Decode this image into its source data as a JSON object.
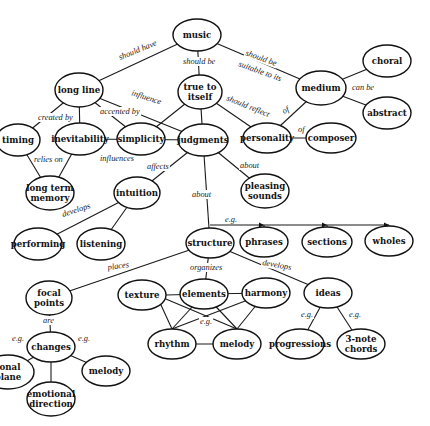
{
  "diagram": {
    "nodes": [
      {
        "id": "music",
        "lines": [
          "music"
        ],
        "x": 197,
        "y": 35,
        "rx": 24,
        "ry": 16
      },
      {
        "id": "long_line",
        "lines": [
          "long line"
        ],
        "x": 79,
        "y": 90,
        "rx": 24,
        "ry": 17
      },
      {
        "id": "true_to_itself",
        "lines": [
          "true to",
          "itself"
        ],
        "x": 200,
        "y": 92,
        "rx": 22,
        "ry": 17
      },
      {
        "id": "medium",
        "lines": [
          "medium"
        ],
        "x": 321,
        "y": 88,
        "rx": 25,
        "ry": 17
      },
      {
        "id": "choral",
        "lines": [
          "choral"
        ],
        "x": 387,
        "y": 61,
        "rx": 24,
        "ry": 16
      },
      {
        "id": "abstract",
        "lines": [
          "abstract"
        ],
        "x": 387,
        "y": 113,
        "rx": 24,
        "ry": 16
      },
      {
        "id": "timing",
        "lines": [
          "timing"
        ],
        "x": 18,
        "y": 140,
        "rx": 22,
        "ry": 16
      },
      {
        "id": "inevitability",
        "lines": [
          "inevitability"
        ],
        "x": 80,
        "y": 139,
        "rx": 25,
        "ry": 16
      },
      {
        "id": "simplicity",
        "lines": [
          "simplicity"
        ],
        "x": 141,
        "y": 139,
        "rx": 24,
        "ry": 16
      },
      {
        "id": "judgments",
        "lines": [
          "judgments"
        ],
        "x": 203,
        "y": 140,
        "rx": 25,
        "ry": 16
      },
      {
        "id": "personality",
        "lines": [
          "personality"
        ],
        "x": 267,
        "y": 138,
        "rx": 24,
        "ry": 15
      },
      {
        "id": "composer",
        "lines": [
          "composer"
        ],
        "x": 331,
        "y": 138,
        "rx": 25,
        "ry": 15
      },
      {
        "id": "long_term_memory",
        "lines": [
          "long term",
          "memory"
        ],
        "x": 50,
        "y": 193,
        "rx": 24,
        "ry": 17
      },
      {
        "id": "intuition",
        "lines": [
          "intuition"
        ],
        "x": 137,
        "y": 193,
        "rx": 23,
        "ry": 16
      },
      {
        "id": "pleasing_sounds",
        "lines": [
          "pleasing",
          "sounds"
        ],
        "x": 265,
        "y": 191,
        "rx": 24,
        "ry": 17
      },
      {
        "id": "performing",
        "lines": [
          "performing"
        ],
        "x": 38,
        "y": 244,
        "rx": 24,
        "ry": 16
      },
      {
        "id": "listening",
        "lines": [
          "listening"
        ],
        "x": 101,
        "y": 244,
        "rx": 24,
        "ry": 16
      },
      {
        "id": "structure",
        "lines": [
          "structure"
        ],
        "x": 210,
        "y": 243,
        "rx": 24,
        "ry": 15
      },
      {
        "id": "phrases",
        "lines": [
          "phrases"
        ],
        "x": 264,
        "y": 242,
        "rx": 24,
        "ry": 15
      },
      {
        "id": "sections",
        "lines": [
          "sections"
        ],
        "x": 327,
        "y": 242,
        "rx": 25,
        "ry": 15
      },
      {
        "id": "wholes",
        "lines": [
          "wholes"
        ],
        "x": 389,
        "y": 241,
        "rx": 24,
        "ry": 15
      },
      {
        "id": "focal_points",
        "lines": [
          "focal",
          "points"
        ],
        "x": 49,
        "y": 298,
        "rx": 23,
        "ry": 17
      },
      {
        "id": "texture",
        "lines": [
          "texture"
        ],
        "x": 142,
        "y": 295,
        "rx": 24,
        "ry": 15
      },
      {
        "id": "elements",
        "lines": [
          "elements"
        ],
        "x": 204,
        "y": 294,
        "rx": 24,
        "ry": 15
      },
      {
        "id": "harmony",
        "lines": [
          "harmony"
        ],
        "x": 266,
        "y": 293,
        "rx": 24,
        "ry": 15
      },
      {
        "id": "ideas",
        "lines": [
          "ideas"
        ],
        "x": 328,
        "y": 293,
        "rx": 24,
        "ry": 15
      },
      {
        "id": "changes",
        "lines": [
          "changes"
        ],
        "x": 51,
        "y": 347,
        "rx": 24,
        "ry": 15
      },
      {
        "id": "rhythm",
        "lines": [
          "rhythm"
        ],
        "x": 172,
        "y": 344,
        "rx": 24,
        "ry": 15
      },
      {
        "id": "melody_a",
        "lines": [
          "melody"
        ],
        "x": 237,
        "y": 344,
        "rx": 24,
        "ry": 15
      },
      {
        "id": "progressions",
        "lines": [
          "progressions"
        ],
        "x": 300,
        "y": 344,
        "rx": 24,
        "ry": 15
      },
      {
        "id": "three_note_chords",
        "lines": [
          "3-note",
          "chords"
        ],
        "x": 361,
        "y": 344,
        "rx": 24,
        "ry": 15
      },
      {
        "id": "tonal_plane",
        "lines": [
          "tonal",
          "plane"
        ],
        "x": 8,
        "y": 372,
        "rx": 26,
        "ry": 17
      },
      {
        "id": "melody_b",
        "lines": [
          "melody"
        ],
        "x": 106,
        "y": 371,
        "rx": 24,
        "ry": 15
      },
      {
        "id": "emotional_direction",
        "lines": [
          "emotional",
          "direction"
        ],
        "x": 51,
        "y": 399,
        "rx": 24,
        "ry": 17
      }
    ],
    "edges": [
      {
        "from": "music",
        "to": "long_line",
        "label": "should have",
        "lx": 120,
        "ly": 60,
        "rot": -22
      },
      {
        "from": "music",
        "to": "true_to_itself",
        "label": "should be",
        "lx": 183,
        "ly": 64,
        "rot": 0
      },
      {
        "from": "music",
        "to": "medium",
        "label": "should be",
        "lx": 245,
        "ly": 55,
        "rot": 20
      },
      {
        "from": null,
        "to": null,
        "label": "suitable to its",
        "lx": 238,
        "ly": 66,
        "rot": 20
      },
      {
        "from": "medium",
        "to": "choral",
        "label": "can be",
        "lx": 352,
        "ly": 90,
        "rot": 0
      },
      {
        "from": "medium",
        "to": "abstract",
        "label": "",
        "lx": 0,
        "ly": 0,
        "rot": 0
      },
      {
        "from": "long_line",
        "to": "timing",
        "label": "created by",
        "lx": 38,
        "ly": 120,
        "rot": 0
      },
      {
        "from": "long_line",
        "to": "inevitability",
        "label": "",
        "lx": 0,
        "ly": 0,
        "rot": 0
      },
      {
        "from": "long_line",
        "to": "simplicity",
        "label": "accented by",
        "lx": 100,
        "ly": 114,
        "rot": 0
      },
      {
        "from": "long_line",
        "to": "judgments",
        "label": "influence",
        "lx": 131,
        "ly": 95,
        "rot": 18
      },
      {
        "from": "true_to_itself",
        "to": "simplicity",
        "label": "",
        "lx": 0,
        "ly": 0,
        "rot": 0
      },
      {
        "from": "true_to_itself",
        "to": "judgments",
        "label": "",
        "lx": 0,
        "ly": 0,
        "rot": 0
      },
      {
        "from": "true_to_itself",
        "to": "personality",
        "label": "should reflect",
        "lx": 226,
        "ly": 100,
        "rot": 22
      },
      {
        "from": "medium",
        "to": "personality",
        "label": "of",
        "lx": 284,
        "ly": 114,
        "rot": -30
      },
      {
        "from": "personality",
        "to": "composer",
        "label": "of",
        "lx": 298,
        "ly": 132,
        "rot": 0
      },
      {
        "from": "timing",
        "to": "long_term_memory",
        "label": "relies on",
        "lx": 34,
        "ly": 162,
        "rot": 0
      },
      {
        "from": "inevitability",
        "to": "long_term_memory",
        "label": "",
        "lx": 0,
        "ly": 0,
        "rot": 0
      },
      {
        "from": "inevitability",
        "to": "judgments",
        "label": "influences",
        "lx": 100,
        "ly": 161,
        "rot": 0
      },
      {
        "from": "judgments",
        "to": "intuition",
        "label": "affects",
        "lx": 147,
        "ly": 169,
        "rot": 0
      },
      {
        "from": "judgments",
        "to": "pleasing_sounds",
        "label": "about",
        "lx": 240,
        "ly": 168,
        "rot": 0
      },
      {
        "from": "judgments",
        "to": "structure",
        "label": "about",
        "lx": 192,
        "ly": 197,
        "rot": 0
      },
      {
        "from": "intuition",
        "to": "performing",
        "label": "develops",
        "lx": 63,
        "ly": 217,
        "rot": -18
      },
      {
        "from": "intuition",
        "to": "listening",
        "label": "",
        "lx": 0,
        "ly": 0,
        "rot": 0
      },
      {
        "from": "structure",
        "to": "phrases",
        "label": "e.g.",
        "lx": 225,
        "ly": 222,
        "rot": 0
      },
      {
        "from": "structure",
        "to": "focal_points",
        "label": "places",
        "lx": 108,
        "ly": 270,
        "rot": -8
      },
      {
        "from": "structure",
        "to": "elements",
        "label": "organizes",
        "lx": 190,
        "ly": 270,
        "rot": 0
      },
      {
        "from": "structure",
        "to": "ideas",
        "label": "develops",
        "lx": 262,
        "ly": 265,
        "rot": 10
      },
      {
        "from": "focal_points",
        "to": "changes",
        "label": "are",
        "lx": 43,
        "ly": 323,
        "rot": 0
      },
      {
        "from": "changes",
        "to": "tonal_plane",
        "label": "e.g.",
        "lx": 12,
        "ly": 341,
        "rot": 0
      },
      {
        "from": "changes",
        "to": "melody_b",
        "label": "e.g.",
        "lx": 78,
        "ly": 341,
        "rot": 0
      },
      {
        "from": "changes",
        "to": "emotional_direction",
        "label": "",
        "lx": 0,
        "ly": 0,
        "rot": 0
      },
      {
        "from": "elements",
        "to": "rhythm",
        "label": "e.g.",
        "lx": 200,
        "ly": 324,
        "rot": 0
      },
      {
        "from": "ideas",
        "to": "progressions",
        "label": "e.g.",
        "lx": 301,
        "ly": 317,
        "rot": 0
      },
      {
        "from": "ideas",
        "to": "three_note_chords",
        "label": "e.g.",
        "lx": 349,
        "ly": 317,
        "rot": 0
      }
    ],
    "colors": {
      "stroke": "#111111",
      "background": "#ffffff",
      "text": "#111111"
    }
  }
}
